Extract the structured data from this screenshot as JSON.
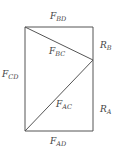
{
  "diagram": {
    "type": "truss-free-body",
    "colors": {
      "line": "#555555",
      "text": "#444444",
      "background": "#ffffff"
    },
    "nodes": [
      "A",
      "B",
      "C",
      "D"
    ],
    "members": [
      {
        "id": "BD",
        "from": "D-top-left",
        "to": "B-top-right",
        "label": {
          "main": "F",
          "sub": "BD"
        }
      },
      {
        "id": "CD",
        "from": "D-top-left",
        "to": "A-bottom-left",
        "label": {
          "main": "F",
          "sub": "CD"
        }
      },
      {
        "id": "AD",
        "from": "A-bottom-left",
        "to": "bottom-right",
        "label": {
          "main": "F",
          "sub": "AD"
        }
      },
      {
        "id": "BC",
        "from": "D-top-left",
        "to": "C-right-mid",
        "label": {
          "main": "F",
          "sub": "BC"
        }
      },
      {
        "id": "AC",
        "from": "A-bottom-left",
        "to": "C-right-mid",
        "label": {
          "main": "F",
          "sub": "AC"
        }
      }
    ],
    "reactions": [
      {
        "id": "RB",
        "label": {
          "main": "R",
          "sub": "B"
        }
      },
      {
        "id": "RA",
        "label": {
          "main": "R",
          "sub": "A"
        }
      }
    ]
  }
}
